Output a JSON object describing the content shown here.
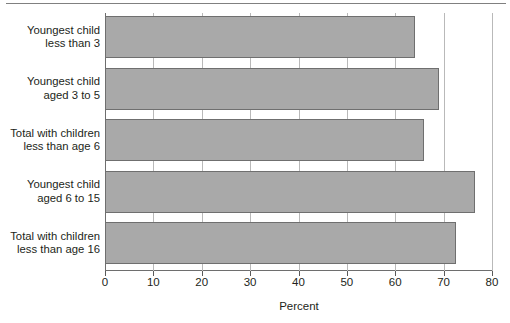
{
  "chart_data": {
    "type": "bar",
    "orientation": "horizontal",
    "title": "",
    "subtitle": "",
    "xlabel": "Percent",
    "ylabel": "",
    "xlim": [
      0,
      80
    ],
    "xticks": [
      0,
      10,
      20,
      30,
      40,
      50,
      60,
      70,
      80
    ],
    "xtick_labels": [
      "0",
      "10",
      "20",
      "30",
      "40",
      "50",
      "60",
      "70",
      "80"
    ],
    "grid": true,
    "grid_axis": "x",
    "legend": false,
    "legend_position": "none",
    "bar_color": "#a9a9a9",
    "bar_edge_color": "#6f6f6f",
    "categories": [
      "Youngest child\nless than 3",
      "Youngest child\naged 3 to 5",
      "Total with children\nless than age 6",
      "Youngest child\naged 6 to 15",
      "Total with children\nless than age 16"
    ],
    "values": [
      64.0,
      69.0,
      66.0,
      76.5,
      72.5
    ]
  },
  "axis": {
    "x_title": "Percent"
  }
}
